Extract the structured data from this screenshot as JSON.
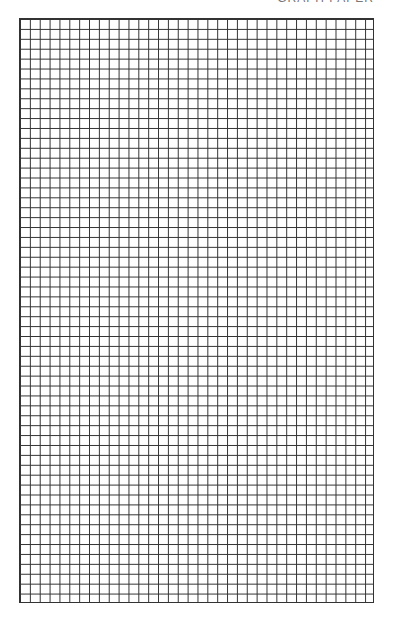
{
  "header": {
    "text": "GRAPH PAPER"
  },
  "grid": {
    "columns": 36,
    "rows": 59,
    "line_color": "#333333",
    "background_color": "#ffffff"
  }
}
